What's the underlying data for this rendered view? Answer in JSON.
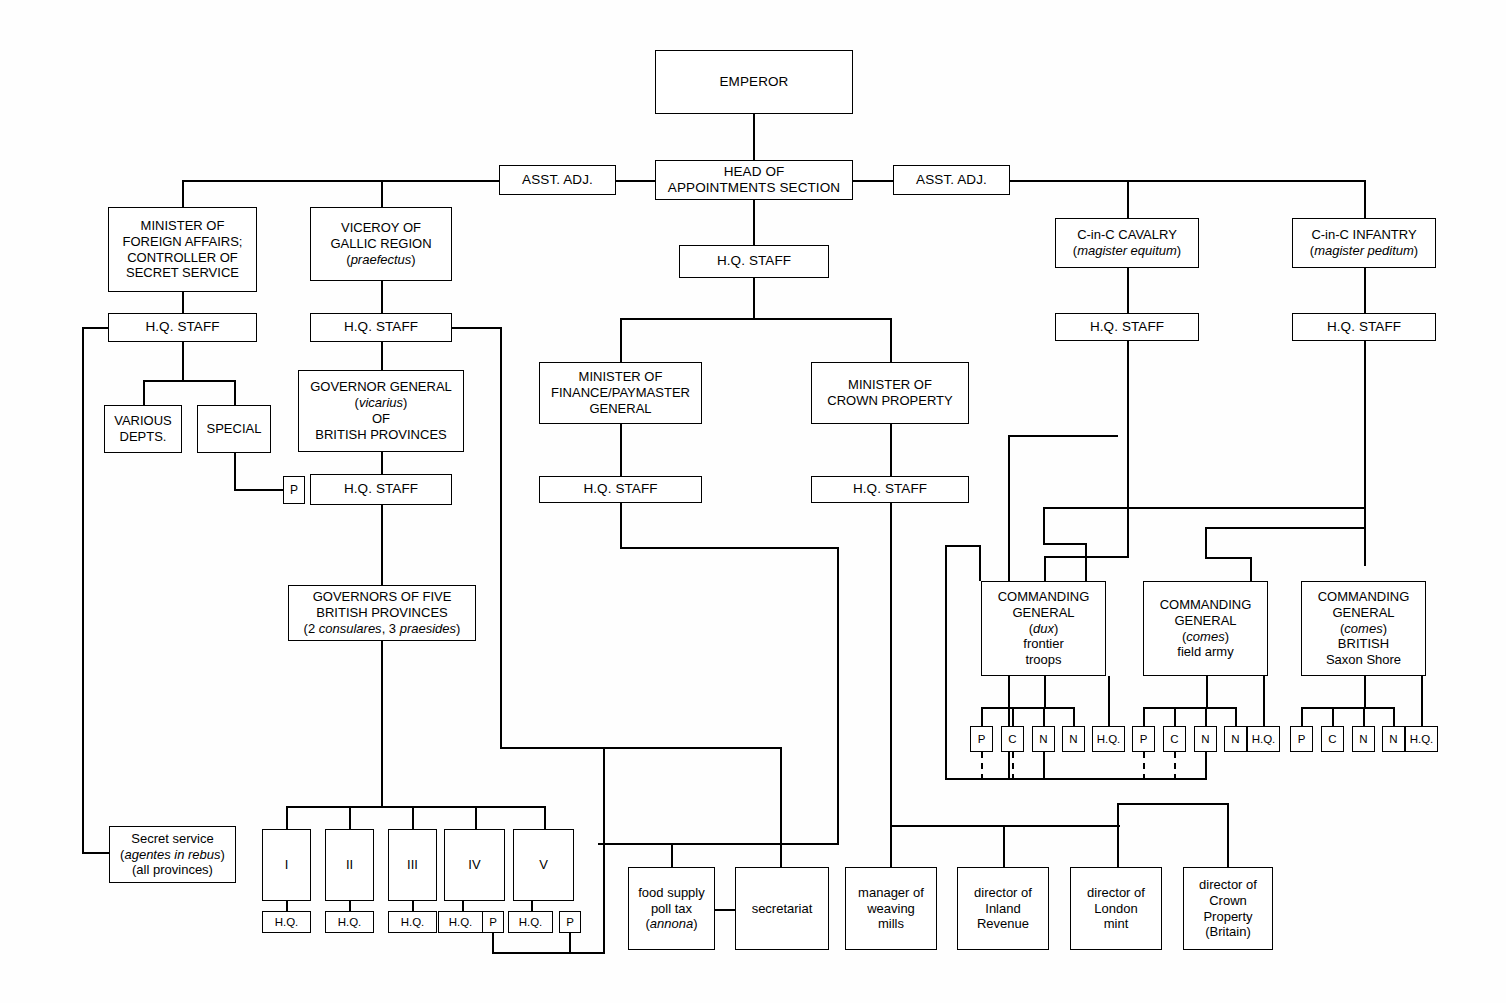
{
  "diagram": {
    "line_color": "#000000",
    "background_color": "#ffffff"
  },
  "nodes": {
    "emperor": "EMPEROR",
    "head_appointments": "HEAD OF\nAPPOINTMENTS SECTION",
    "asst_adj_left": "ASST. ADJ.",
    "asst_adj_right": "ASST. ADJ.",
    "hq_head": "H.Q. STAFF",
    "minister_foreign": "MINISTER OF\nFOREIGN AFFAIRS;\nCONTROLLER OF\nSECRET SERVICE",
    "hq_foreign": "H.Q. STAFF",
    "various_depts": "VARIOUS\nDEPTS.",
    "special": "SPECIAL",
    "secret_service_l1": "Secret service",
    "secret_service_l2": "(agentes in rebus)",
    "secret_service_l3": "(all provinces)",
    "viceroy_l1": "VICEROY OF",
    "viceroy_l2": "GALLIC REGION",
    "viceroy_l3": "(praefectus)",
    "hq_viceroy": "H.Q. STAFF",
    "gov_general_l1": "GOVERNOR GENERAL",
    "gov_general_l2": "(vicarius)",
    "gov_general_l3": "OF",
    "gov_general_l4": "BRITISH PROVINCES",
    "hq_govgeneral": "H.Q. STAFF",
    "p_govgeneral": "P",
    "governors_l1": "GOVERNORS OF FIVE",
    "governors_l2": "BRITISH PROVINCES",
    "governors_l3": "(2 consulares, 3 praesides)",
    "province_1": "I",
    "province_2": "II",
    "province_3": "III",
    "province_4": "IV",
    "province_5": "V",
    "hq_p1": "H.Q.",
    "hq_p2": "H.Q.",
    "hq_p3": "H.Q.",
    "hq_p4": "H.Q.",
    "hq_p5": "H.Q.",
    "p_p4": "P",
    "p_p5": "P",
    "minister_finance": "MINISTER OF\nFINANCE/PAYMASTER\nGENERAL",
    "hq_finance": "H.Q. STAFF",
    "minister_crown": "MINISTER OF\nCROWN PROPERTY",
    "hq_crown": "H.Q. STAFF",
    "food_supply_l1": "food supply",
    "food_supply_l2": "poll tax",
    "food_supply_l3": "(annona)",
    "secretariat": "secretariat",
    "weaving_l1": "manager of",
    "weaving_l2": "weaving",
    "weaving_l3": "mills",
    "inland_l1": "director of",
    "inland_l2": "Inland",
    "inland_l3": "Revenue",
    "mint_l1": "director of",
    "mint_l2": "London",
    "mint_l3": "mint",
    "crownprop_l1": "director of",
    "crownprop_l2": "Crown",
    "crownprop_l3": "Property",
    "crownprop_l4": "(Britain)",
    "cinc_cavalry_l1": "C-in-C CAVALRY",
    "cinc_cavalry_l2": "(magister equitum)",
    "hq_cavalry": "H.Q. STAFF",
    "cinc_infantry_l1": "C-in-C INFANTRY",
    "cinc_infantry_l2": "(magister peditum)",
    "hq_infantry": "H.Q. STAFF",
    "cg_frontier_l1": "COMMANDING",
    "cg_frontier_l2": "GENERAL",
    "cg_frontier_l3": "(dux)",
    "cg_frontier_l4": "frontier",
    "cg_frontier_l5": "troops",
    "cg_field_l1": "COMMANDING",
    "cg_field_l2": "GENERAL",
    "cg_field_l3": "(comes)",
    "cg_field_l4": "field army",
    "cg_saxon_l1": "COMMANDING",
    "cg_saxon_l2": "GENERAL",
    "cg_saxon_l3": "(comes)",
    "cg_saxon_l4": "BRITISH",
    "cg_saxon_l5": "Saxon Shore",
    "staff_a_p": "P",
    "staff_a_c": "C",
    "staff_a_n1": "N",
    "staff_a_n2": "N",
    "staff_a_hq": "H.Q.",
    "staff_b_p": "P",
    "staff_b_c": "C",
    "staff_b_n1": "N",
    "staff_b_n2": "N",
    "staff_b_hq": "H.Q.",
    "staff_c_p": "P",
    "staff_c_c": "C",
    "staff_c_n1": "N",
    "staff_c_n2": "N",
    "staff_c_hq": "H.Q."
  }
}
